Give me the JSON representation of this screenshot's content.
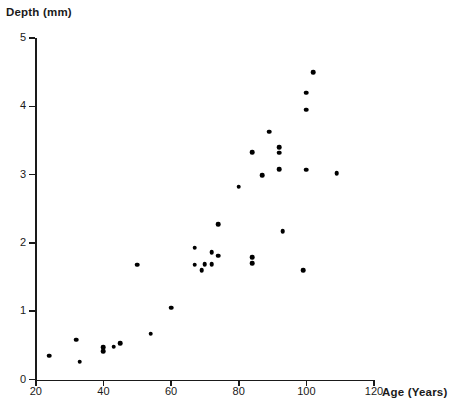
{
  "chart_data": {
    "type": "scatter",
    "title": "",
    "xlabel": "Age (Years)",
    "ylabel": "Depth (mm)",
    "xlim": [
      20,
      120
    ],
    "ylim": [
      0,
      5
    ],
    "xticks": [
      20,
      40,
      60,
      80,
      100,
      120
    ],
    "yticks": [
      0,
      1,
      2,
      3,
      4,
      5
    ],
    "xtick_labels": [
      "20",
      "40",
      "60",
      "80",
      "100",
      "120"
    ],
    "ytick_labels": [
      "0",
      "1",
      "2",
      "3",
      "4",
      "5"
    ],
    "grid": false,
    "legend": null,
    "marker": "filled-circle",
    "marker_color": "#000000",
    "points": [
      {
        "age": 24,
        "depth": 0.35
      },
      {
        "age": 32,
        "depth": 0.58
      },
      {
        "age": 33,
        "depth": 0.26
      },
      {
        "age": 40,
        "depth": 0.47
      },
      {
        "age": 40,
        "depth": 0.41
      },
      {
        "age": 43,
        "depth": 0.48
      },
      {
        "age": 45,
        "depth": 0.53
      },
      {
        "age": 54,
        "depth": 0.67
      },
      {
        "age": 50,
        "depth": 1.68
      },
      {
        "age": 60,
        "depth": 1.05
      },
      {
        "age": 67,
        "depth": 1.93
      },
      {
        "age": 67,
        "depth": 1.68
      },
      {
        "age": 69,
        "depth": 1.6
      },
      {
        "age": 72,
        "depth": 1.86
      },
      {
        "age": 74,
        "depth": 1.81
      },
      {
        "age": 70,
        "depth": 1.69
      },
      {
        "age": 72,
        "depth": 1.69
      },
      {
        "age": 74,
        "depth": 2.27
      },
      {
        "age": 80,
        "depth": 2.82
      },
      {
        "age": 84,
        "depth": 1.7
      },
      {
        "age": 84,
        "depth": 1.79
      },
      {
        "age": 84,
        "depth": 3.33
      },
      {
        "age": 87,
        "depth": 2.99
      },
      {
        "age": 89,
        "depth": 3.63
      },
      {
        "age": 92,
        "depth": 3.4
      },
      {
        "age": 92,
        "depth": 3.32
      },
      {
        "age": 93,
        "depth": 2.17
      },
      {
        "age": 92,
        "depth": 3.08
      },
      {
        "age": 100,
        "depth": 4.2
      },
      {
        "age": 102,
        "depth": 4.5
      },
      {
        "age": 100,
        "depth": 3.95
      },
      {
        "age": 100,
        "depth": 3.07
      },
      {
        "age": 99,
        "depth": 1.6
      },
      {
        "age": 109,
        "depth": 3.02
      }
    ]
  },
  "axes": {
    "y_title": "Depth (mm)",
    "x_title": "Age (Years)"
  }
}
